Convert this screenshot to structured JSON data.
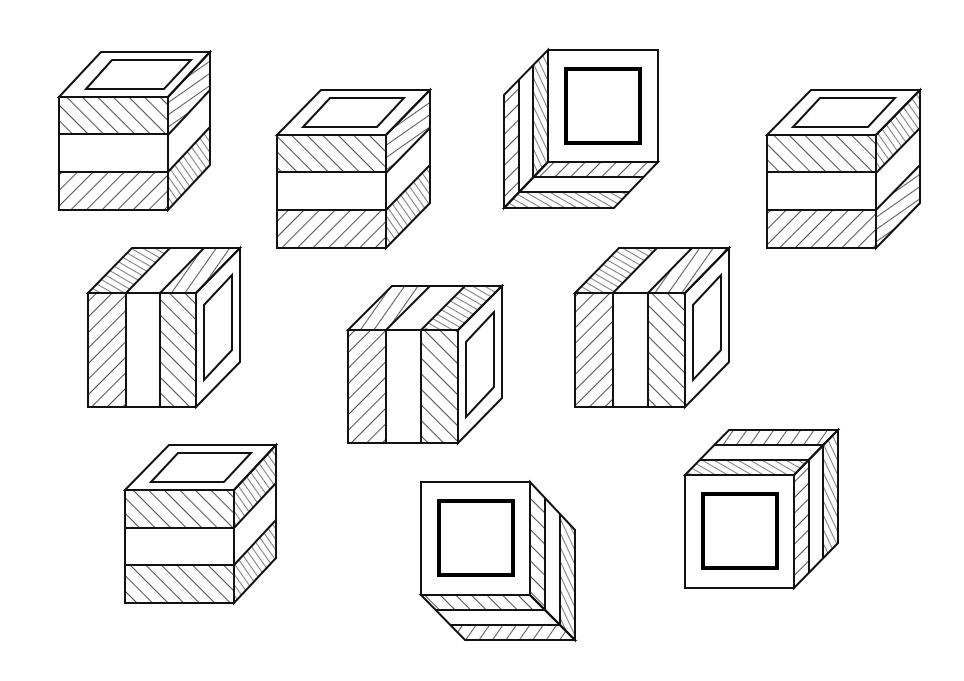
{
  "figure": {
    "title": "",
    "line_color": "#111111",
    "background": "#ffffff"
  },
  "cubes": [
    {
      "id": 1,
      "view": "top-right",
      "front": "horizontal-bands",
      "top": "square-frame",
      "side": "hatched-bands"
    },
    {
      "id": 2,
      "view": "top-right",
      "front": "horizontal-bands",
      "top": "square-frame",
      "side": "hatched-bands"
    },
    {
      "id": 3,
      "view": "bottom-left",
      "front": "bold-square-frame",
      "side": "vertical-bands",
      "bottom": "horizontal-bands"
    },
    {
      "id": 4,
      "view": "top-right",
      "front": "horizontal-bands",
      "top": "square-frame",
      "side": "hatched-bands"
    },
    {
      "id": 5,
      "view": "top-right",
      "front": "vertical-bands",
      "top": "hatched-bands",
      "side": "square-frame"
    },
    {
      "id": 6,
      "view": "top-right",
      "front": "vertical-bands",
      "top": "hatched-bands",
      "side": "square-frame"
    },
    {
      "id": 7,
      "view": "top-right",
      "front": "vertical-bands",
      "top": "hatched-bands",
      "side": "square-frame"
    },
    {
      "id": 8,
      "view": "top-right",
      "front": "horizontal-bands",
      "top": "square-frame",
      "side": "hatched-bands"
    },
    {
      "id": 9,
      "view": "bottom-right",
      "front": "bold-square-frame",
      "side": "vertical-bands",
      "bottom": "horizontal-bands"
    },
    {
      "id": 10,
      "view": "top-right",
      "front": "bold-square-frame",
      "top": "hatched-bands",
      "side": "vertical-bands"
    }
  ]
}
